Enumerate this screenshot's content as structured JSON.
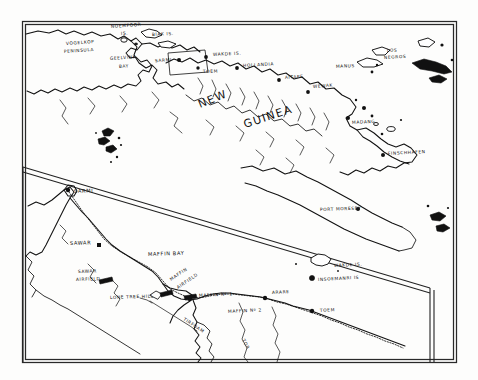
{
  "map": {
    "title": "Hand-drawn map of northern New Guinea and the Sarmi–Wakde–Maffin Bay area",
    "style": "pen-and-ink line map, black on white",
    "frame": {
      "present": true,
      "double_border": true
    },
    "panels": [
      {
        "name": "overview-panel",
        "description": "Northern New Guinea overview, Vogelkop to Finschhafen"
      },
      {
        "name": "detail-inset-panel",
        "description": "Enlarged detail of Sarmi to Toem coastal strip"
      }
    ],
    "overview_labels": [
      {
        "id": "noemfoor",
        "text": "NOEMFOOR",
        "x": 111,
        "y": 28,
        "rotate": -4,
        "size": "xs"
      },
      {
        "id": "noemfoor2",
        "text": "IS.",
        "x": 121,
        "y": 35,
        "rotate": -4,
        "size": "xs"
      },
      {
        "id": "biak",
        "text": "BIAK  IS.",
        "x": 152,
        "y": 36,
        "rotate": -3,
        "size": "xs"
      },
      {
        "id": "vogelkop",
        "text": "VOGELKOP",
        "x": 66,
        "y": 45,
        "rotate": -4,
        "size": "xs"
      },
      {
        "id": "vogelkop2",
        "text": "PENINSULA",
        "x": 64,
        "y": 53,
        "rotate": -4,
        "size": "xs"
      },
      {
        "id": "geelvink",
        "text": "GEELVINK",
        "x": 110,
        "y": 60,
        "rotate": -4,
        "size": "xs"
      },
      {
        "id": "geelvink2",
        "text": "BAY",
        "x": 119,
        "y": 68,
        "rotate": -4,
        "size": "xs"
      },
      {
        "id": "sarmi-top",
        "text": "SARMI",
        "x": 172,
        "y": 61,
        "rotate": -4,
        "size": "xs"
      },
      {
        "id": "wakde-top",
        "text": "WAKDE IS.",
        "x": 213,
        "y": 56,
        "rotate": -3,
        "size": "xs"
      },
      {
        "id": "toem-top",
        "text": "TOEM",
        "x": 203,
        "y": 73,
        "rotate": -2,
        "size": "xs"
      },
      {
        "id": "hollandia",
        "text": "HOLLANDIA",
        "x": 243,
        "y": 67,
        "rotate": -3,
        "size": "xs"
      },
      {
        "id": "aitape",
        "text": "AITAPE",
        "x": 285,
        "y": 79,
        "rotate": -4,
        "size": "xs"
      },
      {
        "id": "wewak",
        "text": "WEWAK",
        "x": 313,
        "y": 88,
        "rotate": -4,
        "size": "xs"
      },
      {
        "id": "manus",
        "text": "MANUS",
        "x": 355,
        "y": 67,
        "rotate": -3,
        "size": "xs"
      },
      {
        "id": "los-negros",
        "text": "LOS",
        "x": 387,
        "y": 52,
        "rotate": -3,
        "size": "xs"
      },
      {
        "id": "los-negros2",
        "text": "NEGROS",
        "x": 384,
        "y": 59,
        "rotate": -3,
        "size": "xs"
      },
      {
        "id": "madang",
        "text": "MADANG",
        "x": 352,
        "y": 124,
        "rotate": -3,
        "size": "xs"
      },
      {
        "id": "finschhafen",
        "text": "FINSCHHAFEN",
        "x": 388,
        "y": 155,
        "rotate": -3,
        "size": "xs"
      },
      {
        "id": "port-moresby",
        "text": "PORT MORESBY",
        "x": 320,
        "y": 211,
        "rotate": -2,
        "size": "xs"
      }
    ],
    "region_labels": [
      {
        "id": "new",
        "text": "NEW",
        "x": 200,
        "y": 108,
        "rotate": -22
      },
      {
        "id": "guinea",
        "text": "GUINEA",
        "x": 245,
        "y": 128,
        "rotate": -18
      }
    ],
    "inset_labels": [
      {
        "id": "sarmi-inset",
        "text": "SARMI",
        "x": 74,
        "y": 193,
        "rotate": -2,
        "size": "sm"
      },
      {
        "id": "sawar",
        "text": "SAWAR",
        "x": 70,
        "y": 245,
        "rotate": -2,
        "size": "sm"
      },
      {
        "id": "sawar-airfield",
        "text": "SAWAR",
        "x": 78,
        "y": 273,
        "rotate": -2,
        "size": "xs"
      },
      {
        "id": "sawar-airfield2",
        "text": "AIRFIELD",
        "x": 76,
        "y": 281,
        "rotate": -2,
        "size": "xs"
      },
      {
        "id": "maffin-bay",
        "text": "MAFFIN   BAY",
        "x": 148,
        "y": 256,
        "rotate": -2,
        "size": "sm"
      },
      {
        "id": "maffin-airfield",
        "text": "MAFFIN",
        "x": 171,
        "y": 281,
        "rotate": -34,
        "size": "xs"
      },
      {
        "id": "maffin-airfield2",
        "text": "AIRFIELD",
        "x": 178,
        "y": 289,
        "rotate": -34,
        "size": "xs"
      },
      {
        "id": "lone-tree-hill",
        "text": "LONE  TREE  HILL",
        "x": 110,
        "y": 299,
        "rotate": -2,
        "size": "xs"
      },
      {
        "id": "maffin-no1",
        "text": "MAFFIN  Nº 1",
        "x": 199,
        "y": 297,
        "rotate": -3,
        "size": "xs"
      },
      {
        "id": "maffin-no2",
        "text": "MAFFIN  Nº 2",
        "x": 228,
        "y": 313,
        "rotate": -3,
        "size": "xs"
      },
      {
        "id": "arare",
        "text": "ARARE",
        "x": 272,
        "y": 294,
        "rotate": -3,
        "size": "xs"
      },
      {
        "id": "toem-inset",
        "text": "TOEM",
        "x": 320,
        "y": 312,
        "rotate": -3,
        "size": "xs"
      },
      {
        "id": "wakde-inset",
        "text": "WAKDE  IS.",
        "x": 334,
        "y": 267,
        "rotate": -3,
        "size": "xs"
      },
      {
        "id": "insoemanri",
        "text": "INSOEMANRI  IS",
        "x": 318,
        "y": 281,
        "rotate": -3,
        "size": "xs"
      },
      {
        "id": "tirfoam",
        "text": "TIRFOAM",
        "x": 183,
        "y": 320,
        "rotate": 33,
        "size": "xs"
      },
      {
        "id": "tor-river",
        "text": "TOR",
        "x": 242,
        "y": 340,
        "rotate": 62,
        "size": "xs"
      }
    ],
    "settlement_dots": [
      {
        "id": "dot-sarmi-top",
        "x": 179,
        "y": 60
      },
      {
        "id": "dot-wakde-top",
        "x": 206,
        "y": 57
      },
      {
        "id": "dot-toem-top",
        "x": 198,
        "y": 68
      },
      {
        "id": "dot-hollandia",
        "x": 237,
        "y": 68
      },
      {
        "id": "dot-aitape",
        "x": 279,
        "y": 80
      },
      {
        "id": "dot-wewak",
        "x": 308,
        "y": 92
      },
      {
        "id": "dot-madang",
        "x": 348,
        "y": 118
      },
      {
        "id": "dot-finschhafen",
        "x": 383,
        "y": 155
      },
      {
        "id": "dot-moresby",
        "x": 358,
        "y": 209
      },
      {
        "id": "dot-sarmi-inset",
        "x": 68,
        "y": 190
      },
      {
        "id": "dot-sawar",
        "x": 99,
        "y": 245
      },
      {
        "id": "dot-maffin1",
        "x": 190,
        "y": 299
      },
      {
        "id": "dot-arare",
        "x": 265,
        "y": 298
      },
      {
        "id": "dot-toem-inset",
        "x": 312,
        "y": 311
      },
      {
        "id": "dot-insoemanri",
        "x": 312,
        "y": 278
      }
    ],
    "colors": {
      "ink": "#111111",
      "paper": "#fdfdfc",
      "frame": "#2a2a2a"
    }
  }
}
